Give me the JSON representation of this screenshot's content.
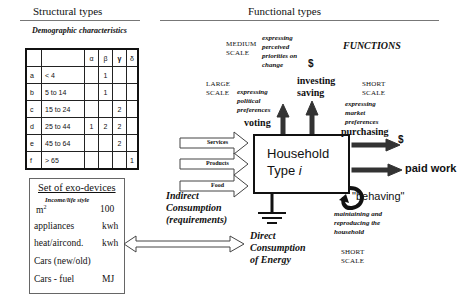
{
  "headers": {
    "structural": "Structural types",
    "functional": "Functional types"
  },
  "demographics": {
    "title": "Demographic characteristics",
    "columns": [
      "",
      "",
      "α",
      "β",
      "γ",
      "δ"
    ],
    "rows": [
      {
        "id": "a",
        "range": "< 4",
        "alpha": "",
        "beta": "1",
        "gamma": "",
        "delta": ""
      },
      {
        "id": "b",
        "range": "5 to 14",
        "alpha": "",
        "beta": "1",
        "gamma": "",
        "delta": ""
      },
      {
        "id": "c",
        "range": "15 to 24",
        "alpha": "",
        "beta": "",
        "gamma": "2",
        "delta": ""
      },
      {
        "id": "d",
        "range": "25 to 44",
        "alpha": "1",
        "beta": "2",
        "gamma": "2",
        "delta": ""
      },
      {
        "id": "e",
        "range": "45 to 64",
        "alpha": "",
        "beta": "",
        "gamma": "2",
        "delta": ""
      },
      {
        "id": "f",
        "range": "> 65",
        "alpha": "",
        "beta": "",
        "gamma": "",
        "delta": "1"
      }
    ]
  },
  "exo_devices": {
    "title": "Set of exo-devices",
    "subtitle": "Income/life style",
    "items": [
      {
        "label": "m²",
        "unit": "100"
      },
      {
        "label": "appliances",
        "unit": "kwh"
      },
      {
        "label": "heat/aircond.",
        "unit": "kwh"
      },
      {
        "label": "Cars (new/old)",
        "unit": ""
      },
      {
        "label": "Cars - fuel",
        "unit": "MJ"
      }
    ]
  },
  "functions": {
    "title": "FUNCTIONS",
    "medium_scale": {
      "scale": "MEDIUM\nSCALE",
      "desc": "expressing perceived priorities on change",
      "dollar": "$",
      "action": "investing saving"
    },
    "large_scale": {
      "scale": "LARGE\nSCALE",
      "desc": "expressing political preferences",
      "action": "voting"
    },
    "short_scale_top": {
      "scale": "SHORT\nSCALE",
      "desc": "expressing market preferences",
      "action": "purchasing",
      "dollar": "$"
    },
    "paid_work": "paid work",
    "behaving": {
      "label": "\"behaving\"",
      "desc": "maintaining and reproducing the household",
      "scale": "SHORT\nSCALE"
    }
  },
  "household": {
    "line1": "Household",
    "line2": "Type ",
    "italic": "i"
  },
  "inputs": [
    "Services",
    "Products",
    "Food"
  ],
  "indirect": "Indirect Consumption (requirements)",
  "direct": "Direct Consumption of Energy"
}
